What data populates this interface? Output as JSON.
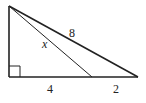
{
  "diagram": {
    "type": "right-triangle-geometry",
    "stroke_color": "#222222",
    "background": "#ffffff",
    "vertices": {
      "top": {
        "x": 9,
        "y": 6
      },
      "bottom_left": {
        "x": 9,
        "y": 77
      },
      "bottom_right": {
        "x": 138,
        "y": 77
      },
      "inner_base_point": {
        "x": 92,
        "y": 77
      }
    },
    "labels": {
      "hypotenuse": "8",
      "inner_segment": "x",
      "base_left_segment": "4",
      "base_right_segment": "2"
    },
    "right_angle_marker": {
      "size": 11
    }
  }
}
